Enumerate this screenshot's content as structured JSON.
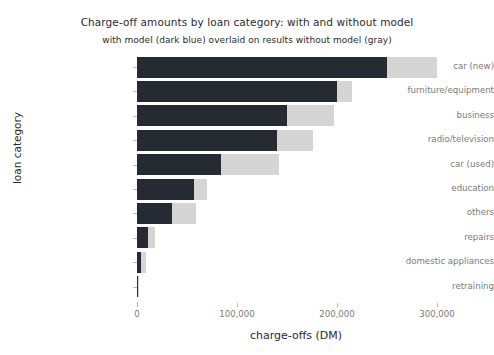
{
  "chart_data": {
    "type": "bar",
    "orientation": "horizontal",
    "title": "Charge-off amounts by loan category: with and without model",
    "subtitle": "with model (dark blue) overlaid on results without model (gray)",
    "xlabel": "charge-offs (DM)",
    "ylabel": "loan category",
    "categories": [
      "car (new)",
      "furniture/equipment",
      "business",
      "radio/television",
      "car (used)",
      "education",
      "others",
      "repairs",
      "domestic appliances",
      "retraining"
    ],
    "series": [
      {
        "name": "without model (gray)",
        "color": "#d5d5d5",
        "values": [
          300000,
          215000,
          197000,
          176000,
          142000,
          70000,
          59000,
          18000,
          9000,
          1500
        ]
      },
      {
        "name": "with model (dark blue)",
        "color": "#262a33",
        "values": [
          250000,
          200000,
          150000,
          140000,
          84000,
          57000,
          35000,
          11000,
          4000,
          600
        ]
      }
    ],
    "xlim": [
      0,
      318000
    ],
    "xticks": [
      0,
      100000,
      200000,
      300000
    ],
    "xtick_labels": [
      "0",
      "100,000",
      "200,000",
      "300,000"
    ],
    "grid": false,
    "legend": "none"
  },
  "colors": {
    "dark_blue": "#262a33",
    "gray": "#d5d5d5",
    "axis": "#b9b9b9",
    "tick_text": "#7a7a7a",
    "label_text": "#2b2b2b",
    "background": "#ffffff"
  }
}
